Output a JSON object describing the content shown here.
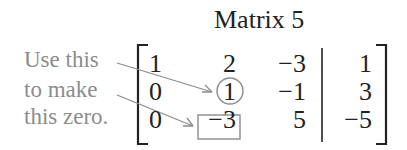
{
  "title": "Matrix 5",
  "annotation": {
    "lines": [
      "Use this",
      "to make",
      "this zero."
    ]
  },
  "matrix": {
    "rows": [
      [
        "1",
        "2",
        "−3",
        "1"
      ],
      [
        "0",
        "1",
        "−1",
        "3"
      ],
      [
        "0",
        "−3",
        "5",
        "−5"
      ]
    ],
    "circled_entry": {
      "row": 1,
      "col": 1
    },
    "boxed_entry": {
      "row": 2,
      "col": 1
    }
  },
  "colors": {
    "text": "#222222",
    "annotation": "#8c8c8c"
  }
}
